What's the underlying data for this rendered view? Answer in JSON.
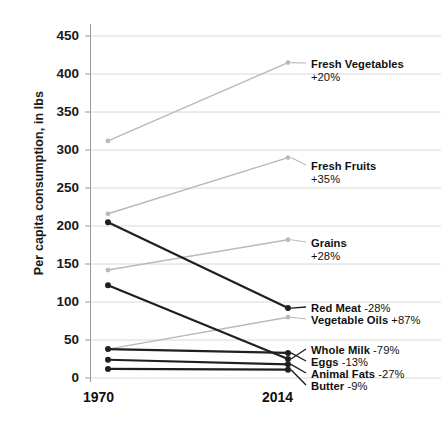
{
  "chart_data": {
    "type": "line",
    "title": "",
    "subtitle": "",
    "xlabel": "",
    "ylabel": "Per capita consumption, in lbs",
    "x": [
      "1970",
      "2014"
    ],
    "categories": [
      "1970",
      "2014"
    ],
    "xlim": [
      1970,
      2014
    ],
    "ylim": [
      0,
      450
    ],
    "yticks": [
      "0",
      "50",
      "100",
      "150",
      "200",
      "250",
      "300",
      "350",
      "400",
      "450"
    ],
    "ytick_values": [
      0,
      50,
      100,
      150,
      200,
      250,
      300,
      350,
      400,
      450
    ],
    "grid": true,
    "legend_position": "right-inline-labels",
    "series": [
      {
        "name": "Fresh Vegetables",
        "change": "+20%",
        "values": [
          312,
          415
        ],
        "color": "#b9b9b9",
        "emphasis": "light",
        "label_layout": "two-line"
      },
      {
        "name": "Fresh Fruits",
        "change": "+35%",
        "values": [
          216,
          290
        ],
        "color": "#b9b9b9",
        "emphasis": "light",
        "label_layout": "two-line"
      },
      {
        "name": "Grains",
        "change": "+28%",
        "values": [
          142,
          182
        ],
        "color": "#b9b9b9",
        "emphasis": "light",
        "label_layout": "two-line"
      },
      {
        "name": "Red Meat",
        "change": "-28%",
        "values": [
          205,
          92
        ],
        "color": "#1f1f1f",
        "emphasis": "dark",
        "label_layout": "inline"
      },
      {
        "name": "Vegetable Oils",
        "change": "+87%",
        "values": [
          38,
          80
        ],
        "color": "#b9b9b9",
        "emphasis": "light",
        "label_layout": "inline"
      },
      {
        "name": "Whole Milk",
        "change": "-79%",
        "values": [
          122,
          25
        ],
        "color": "#1f1f1f",
        "emphasis": "dark",
        "label_layout": "inline"
      },
      {
        "name": "Eggs",
        "change": "-13%",
        "values": [
          38,
          33
        ],
        "color": "#1f1f1f",
        "emphasis": "dark",
        "label_layout": "inline"
      },
      {
        "name": "Animal Fats",
        "change": "-27%",
        "values": [
          24,
          18
        ],
        "color": "#1f1f1f",
        "emphasis": "dark",
        "label_layout": "inline"
      },
      {
        "name": "Butter",
        "change": "-9%",
        "values": [
          12,
          11
        ],
        "color": "#1f1f1f",
        "emphasis": "dark",
        "label_layout": "inline"
      }
    ],
    "colors": {
      "light_series": "#b9b9b9",
      "dark_series": "#1f1f1f",
      "gridline": "#d8d8d8",
      "axis": "#9a9a9a",
      "text": "#111111",
      "background": "#ffffff"
    }
  },
  "labels": {
    "fresh_vegetables": {
      "name": "Fresh Vegetables",
      "change": "+20%"
    },
    "fresh_fruits": {
      "name": "Fresh Fruits",
      "change": "+35%"
    },
    "grains": {
      "name": "Grains",
      "change": "+28%"
    },
    "red_meat": {
      "name": "Red Meat",
      "change": "-28%"
    },
    "vegetable_oils": {
      "name": "Vegetable Oils",
      "change": "+87%"
    },
    "whole_milk": {
      "name": "Whole Milk",
      "change": "-79%"
    },
    "eggs": {
      "name": "Eggs",
      "change": "-13%"
    },
    "animal_fats": {
      "name": "Animal Fats",
      "change": "-27%"
    },
    "butter": {
      "name": "Butter",
      "change": "-9%"
    }
  },
  "axes": {
    "y_title": "Per capita consumption, in lbs",
    "x_left": "1970",
    "x_right": "2014"
  }
}
